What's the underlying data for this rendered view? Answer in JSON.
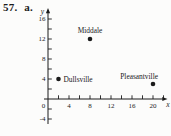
{
  "exercise": {
    "number": "57.",
    "part": "a."
  },
  "colors": {
    "ink": "#1b1b1b",
    "paper": "#fcfcfb"
  },
  "chart_data": {
    "type": "scatter",
    "title": "",
    "xlabel": "x",
    "ylabel": "y",
    "points": [
      {
        "label": "Middale",
        "x": 8,
        "y": 12,
        "label_position": "above"
      },
      {
        "label": "Dullsville",
        "x": 2,
        "y": 4,
        "label_position": "right"
      },
      {
        "label": "Pleasantville",
        "x": 20,
        "y": 3,
        "label_position": "above-left"
      }
    ],
    "x_tick_labels": [
      4,
      8,
      12,
      16,
      20
    ],
    "y_tick_labels": [
      16,
      12,
      8,
      4,
      -4
    ],
    "origin_label": "0",
    "minor_tick_step": 2,
    "x_axis_range": [
      0,
      22
    ],
    "y_axis_range": [
      -5,
      17
    ],
    "grid": false,
    "legend": "none"
  }
}
